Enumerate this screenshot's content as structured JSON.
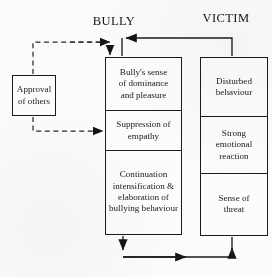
{
  "diagram": {
    "titles": {
      "left": "BULLY",
      "right": "VICTIM"
    },
    "external_box": {
      "label": "Approval\nof others",
      "line1": "Approval",
      "line2": "of others"
    },
    "bully_column": [
      {
        "id": "dominance",
        "line1": "Bully's sense",
        "line2": "of dominance",
        "line3": "and pleasure"
      },
      {
        "id": "suppression",
        "line1": "Suppression of",
        "line2": "empathy",
        "line3": ""
      },
      {
        "id": "continuation",
        "line1": "Continuation",
        "line2": "intensification &",
        "line3": "elaboration of",
        "line4": "bullying behaviour"
      }
    ],
    "victim_column": [
      {
        "id": "disturbed",
        "line1": "Disturbed",
        "line2": "behaviour",
        "line3": ""
      },
      {
        "id": "emotional",
        "line1": "Strong",
        "line2": "emotional",
        "line3": "reaction"
      },
      {
        "id": "threat",
        "line1": "Sense of",
        "line2": "threat",
        "line3": ""
      }
    ],
    "connectors": [
      {
        "id": "approval-to-dominance",
        "style": "dashed",
        "from": "approval-of-others",
        "to": "bullys-sense-of-dominance-and-pleasure"
      },
      {
        "id": "approval-to-suppression",
        "style": "dashed",
        "from": "approval-of-others",
        "to": "suppression-of-empathy"
      },
      {
        "id": "victim-to-bully-top",
        "style": "solid",
        "from": "victim-column",
        "to": "bully-column"
      },
      {
        "id": "bully-to-victim-bottom",
        "style": "solid",
        "from": "bullying-behaviour",
        "to": "sense-of-threat"
      }
    ],
    "colors": {
      "ink": "#1b1b1b",
      "paper": "#fbfbf9"
    }
  }
}
